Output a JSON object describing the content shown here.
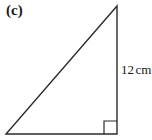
{
  "figure": {
    "part_label": "(c)",
    "background_color": "#ffffff",
    "stroke_color": "#2b2b2b",
    "shape": "right-triangle"
  },
  "labels": {
    "vertical_side": {
      "value": "12",
      "unit": "cm",
      "full": "12 cm"
    }
  },
  "geometry": {
    "apex": {
      "x": 117,
      "y": 6
    },
    "bottom_left": {
      "x": 6,
      "y": 134
    },
    "bottom_right": {
      "x": 117,
      "y": 134
    },
    "right_angle_marker": {
      "size": 13,
      "corner": "bottom-right"
    },
    "stroke_width": 1.4
  }
}
